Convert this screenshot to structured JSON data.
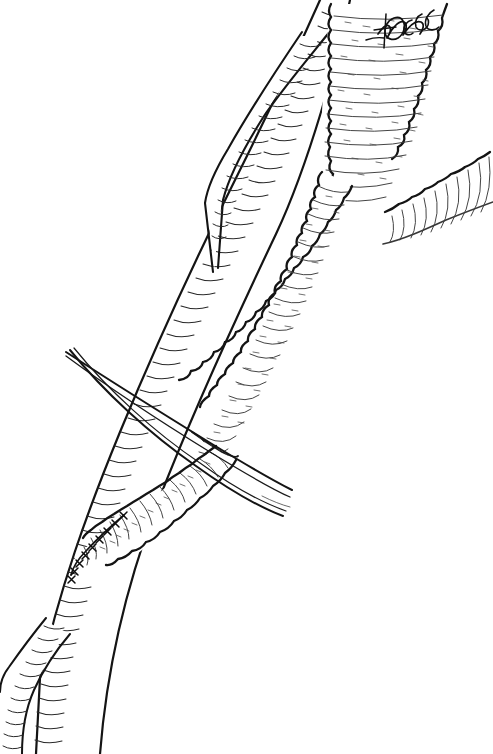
{
  "illustration": {
    "title": "Aortofemoral bypass graft anastomosis",
    "medium": "pen-and-ink line drawing",
    "background_color": "#ffffff",
    "ink_color": "#1a1a1a",
    "shading_color": "#2b2b2b",
    "canvas": {
      "width": 493,
      "height": 754
    }
  },
  "signature": {
    "name": "artist-signature",
    "text": "Roege",
    "style": "cursive handwriting",
    "x": 378,
    "y": 22
  },
  "structures": [
    {
      "id": "aortic-trunk",
      "label": "Aortic trunk (proximal graft body)",
      "surface": "crimped",
      "edge": "scalloped",
      "location": "top-right"
    },
    {
      "id": "bifurcation-right-limb",
      "label": "Right iliac limb",
      "surface": "crimped",
      "edge": "scalloped",
      "location": "upper-right"
    },
    {
      "id": "bifurcation-left-limb",
      "label": "Left iliac limb / descending graft",
      "surface": "crimped",
      "edge": "scalloped",
      "location": "center-diagonal"
    },
    {
      "id": "native-artery-main",
      "label": "Native artery (smooth-walled)",
      "surface": "smooth",
      "edge": "smooth",
      "location": "left-diagonal"
    },
    {
      "id": "native-artery-branch-upper",
      "label": "Upper arterial branch",
      "surface": "smooth",
      "edge": "smooth",
      "location": "upper-left"
    },
    {
      "id": "native-artery-branch-lower",
      "label": "Lower arterial bifurcation",
      "surface": "smooth",
      "edge": "smooth",
      "location": "bottom-left"
    },
    {
      "id": "distal-graft-limb",
      "label": "Distal graft limb to anastomosis",
      "surface": "crimped",
      "edge": "scalloped",
      "location": "lower-center"
    },
    {
      "id": "vessel-loop",
      "label": "Vessel loop / retracting tape",
      "surface": "thin tapering band",
      "edge": "smooth",
      "location": "crossing mid-left"
    }
  ],
  "anastomoses": [
    {
      "id": "distal-anastomosis",
      "label": "Distal end-to-side anastomosis",
      "suture_marks": 9,
      "x": 78,
      "y": 535
    }
  ],
  "annotations": {
    "caption": "Crimped synthetic bypass graft anastomosed to native artery"
  }
}
